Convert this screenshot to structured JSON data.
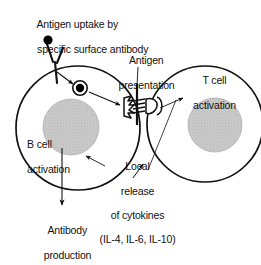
{
  "figure": {
    "type": "biological-process-diagram",
    "background_color": "#ffffff",
    "line_color": "#111111",
    "nucleus_fill": "#c9c9c9",
    "antigen_color": "#000000"
  },
  "labels": {
    "antigen_uptake_line1": "Antigen uptake by",
    "antigen_uptake_line2": "specific surface antibody",
    "antigen_presentation_line1": "Antigen",
    "antigen_presentation_line2": "presentation",
    "t_cell_activation_line1": "T cell",
    "t_cell_activation_line2": "activation",
    "b_cell_activation_line1": "B cell",
    "b_cell_activation_line2": "activation",
    "cytokines_line1": "Local",
    "cytokines_line2": "release",
    "cytokines_line3": "of cytokines",
    "cytokines_line4": "(IL-4, IL-6, IL-10)",
    "antibody_production_line1": "Antibody",
    "antibody_production_line2": "production"
  },
  "cells": [
    {
      "name": "B cell",
      "nucleus": "gray stippled nucleus",
      "membrane": "black outline circle"
    },
    {
      "name": "T cell",
      "nucleus": "gray stippled nucleus",
      "membrane": "black outline circle"
    }
  ],
  "structures": {
    "surface_antibody": "Y-shaped surface immunoglobulin receptor",
    "free_antigen": "solid black dot above antibody",
    "internalized_antigen": "black dot inside ring vesicle",
    "mhc_peptide_complex": "jagged MHC class II with bound peptide",
    "t_cell_receptor": "T cell receptor engaging MHC-peptide"
  },
  "arrows": [
    "antigen into B cell",
    "vesicle to MHC presentation site",
    "antigen presentation pointer",
    "T cell activation pointer",
    "cytokine release from T cell to B cell",
    "B cell activation pointer",
    "B cell to antibody production"
  ]
}
